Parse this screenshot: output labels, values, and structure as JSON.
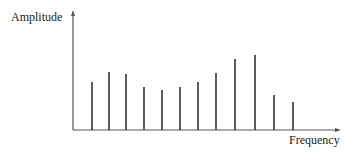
{
  "labels": {
    "y_axis": "Amplitude",
    "x_axis": "Frequency"
  },
  "colors": {
    "line": "#333333",
    "axis": "#555555"
  },
  "chart_data": {
    "type": "bar",
    "title": "",
    "xlabel": "Frequency",
    "ylabel": "Amplitude",
    "grid": false,
    "legend": "none",
    "categories": [
      1,
      2,
      3,
      4,
      5,
      6,
      7,
      8,
      9,
      10,
      11,
      12
    ],
    "values": [
      48,
      58,
      56,
      43,
      40,
      43,
      48,
      57,
      71,
      75,
      35,
      28
    ],
    "x_px": [
      92,
      109,
      126,
      144,
      162,
      180,
      198,
      216,
      235,
      255,
      274,
      293
    ],
    "ylim": [
      0,
      117
    ]
  }
}
